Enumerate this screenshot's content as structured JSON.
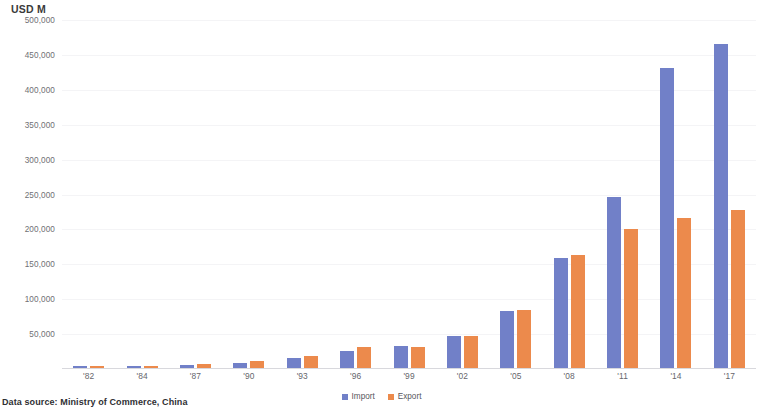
{
  "chart_data": {
    "type": "bar",
    "title": "",
    "subtitle": "",
    "xlabel": "",
    "ylabel": "USD M",
    "categories": [
      "'82",
      "'84",
      "'87",
      "'90",
      "'93",
      "'96",
      "'99",
      "'02",
      "'05",
      "'08",
      "'11",
      "'14",
      "'17"
    ],
    "series": [
      {
        "name": "Import",
        "color": "#7180c8",
        "values": [
          4000,
          5000,
          6000,
          9000,
          16000,
          26000,
          33000,
          47000,
          83000,
          159000,
          247000,
          431000,
          465000
        ]
      },
      {
        "name": "Export",
        "color": "#ec8a4c",
        "values": [
          5000,
          5000,
          7000,
          12000,
          19000,
          31000,
          31000,
          48000,
          85000,
          164000,
          201000,
          217000,
          228000
        ]
      }
    ],
    "ylim": [
      0,
      500000
    ],
    "ytick_values": [
      0,
      50000,
      100000,
      150000,
      200000,
      250000,
      300000,
      350000,
      400000,
      450000,
      500000
    ],
    "ytick_labels": [
      "",
      "50,000",
      "100,000",
      "150,000",
      "200,000",
      "250,000",
      "300,000",
      "350,000",
      "400,000",
      "450,000",
      "500,000"
    ],
    "grid": true,
    "legend_position": "bottom",
    "legend": [
      "Import",
      "Export"
    ]
  },
  "footer": {
    "source_note": "Data source: Ministry of Commerce, China"
  }
}
